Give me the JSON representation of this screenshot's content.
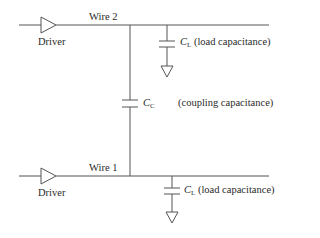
{
  "diagram": {
    "type": "circuit",
    "title": "",
    "colors": {
      "line": "#555555",
      "text": "#2a2a2a",
      "background": "#ffffff"
    },
    "wires": [
      {
        "id": "wire2",
        "label": "Wire 2",
        "driver_label": "Driver"
      },
      {
        "id": "wire1",
        "label": "Wire 1",
        "driver_label": "Driver"
      }
    ],
    "coupling": {
      "symbol": "C",
      "subscript": "C",
      "description": "(coupling capacitance)"
    },
    "loads": [
      {
        "on": "wire2",
        "symbol": "C",
        "subscript": "L",
        "description": "(load capacitance)"
      },
      {
        "on": "wire1",
        "symbol": "C",
        "subscript": "L",
        "description": "(load capacitance)"
      }
    ]
  }
}
